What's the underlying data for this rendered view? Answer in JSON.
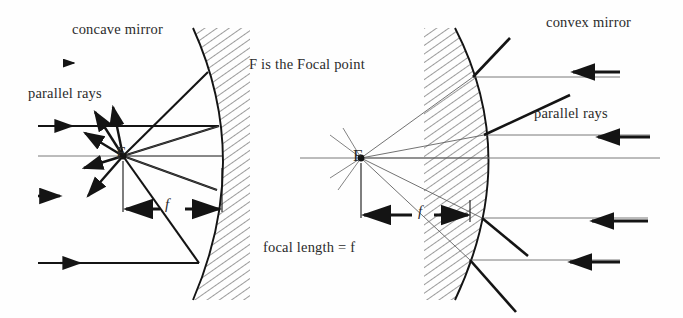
{
  "figure": {
    "background_color": "#fefefe",
    "ink_color": "#1a1a1a",
    "thin_ray_color": "#555555"
  },
  "labels": {
    "concave_mirror": "concave mirror",
    "convex_mirror": "convex mirror",
    "parallel_rays_left": "parallel rays",
    "parallel_rays_right": "parallel rays",
    "focal_point_note": "F is the Focal point",
    "focal_length_note": "focal length = f",
    "focus_marker_left": "F",
    "focus_marker_right": "F",
    "focal_length_symbol_left": "f",
    "focal_length_symbol_right": "f"
  },
  "diagrams": [
    {
      "name": "concave-mirror-diagram",
      "mirror_type": "concave",
      "mirror_vertex": {
        "x": 222,
        "y": 160
      },
      "mirror_top": {
        "x": 193,
        "y": 28
      },
      "mirror_bottom": {
        "x": 193,
        "y": 300
      },
      "hatching_side": "right",
      "focal_point": {
        "x": 123,
        "y": 156
      },
      "focal_length_px": 99,
      "optical_axis_y": 156,
      "incoming_ray_direction": "left-to-right",
      "incoming_rays_y": [
        126,
        156,
        196,
        263
      ],
      "reflection_points": [
        {
          "x": 208,
          "y": 72
        },
        {
          "x": 219,
          "y": 126
        },
        {
          "x": 222,
          "y": 156
        },
        {
          "x": 217,
          "y": 190
        },
        {
          "x": 199,
          "y": 263
        }
      ]
    },
    {
      "name": "convex-mirror-diagram",
      "mirror_type": "convex",
      "mirror_vertex": {
        "x": 489,
        "y": 158
      },
      "mirror_top": {
        "x": 455,
        "y": 28
      },
      "mirror_bottom": {
        "x": 455,
        "y": 300
      },
      "hatching_side": "left",
      "focal_point": {
        "x": 361,
        "y": 158
      },
      "focal_length_px": 128,
      "optical_axis_y": 158,
      "incoming_ray_direction": "right-to-left",
      "incoming_rays_y": [
        77,
        135,
        158,
        218,
        260
      ],
      "reflection_points": [
        {
          "x": 473,
          "y": 77
        },
        {
          "x": 484,
          "y": 135
        },
        {
          "x": 489,
          "y": 158
        },
        {
          "x": 482,
          "y": 218
        },
        {
          "x": 470,
          "y": 260
        }
      ]
    }
  ]
}
